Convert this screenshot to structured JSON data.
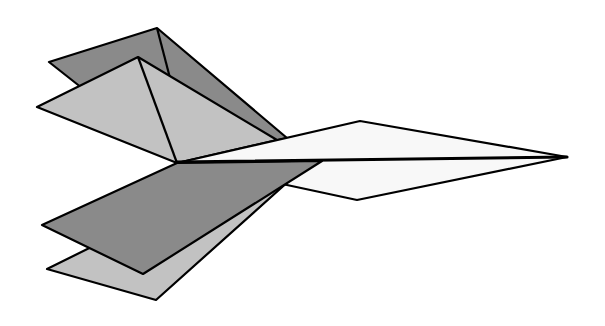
{
  "figure": {
    "colors": {
      "background": "#ffffff",
      "wing_dark": "#8a8a8a",
      "wing_light": "#c2c2c2",
      "fuselage": "#f8f8f8",
      "outline": "#000000"
    },
    "parts": [
      {
        "name": "upper-rear-wing",
        "shade": "wing_dark"
      },
      {
        "name": "upper-front-wing",
        "shade": "wing_light"
      },
      {
        "name": "fuselage",
        "shade": "fuselage"
      },
      {
        "name": "lower-rear-wing",
        "shade": "wing_light"
      },
      {
        "name": "lower-front-wing",
        "shade": "wing_dark"
      }
    ]
  }
}
